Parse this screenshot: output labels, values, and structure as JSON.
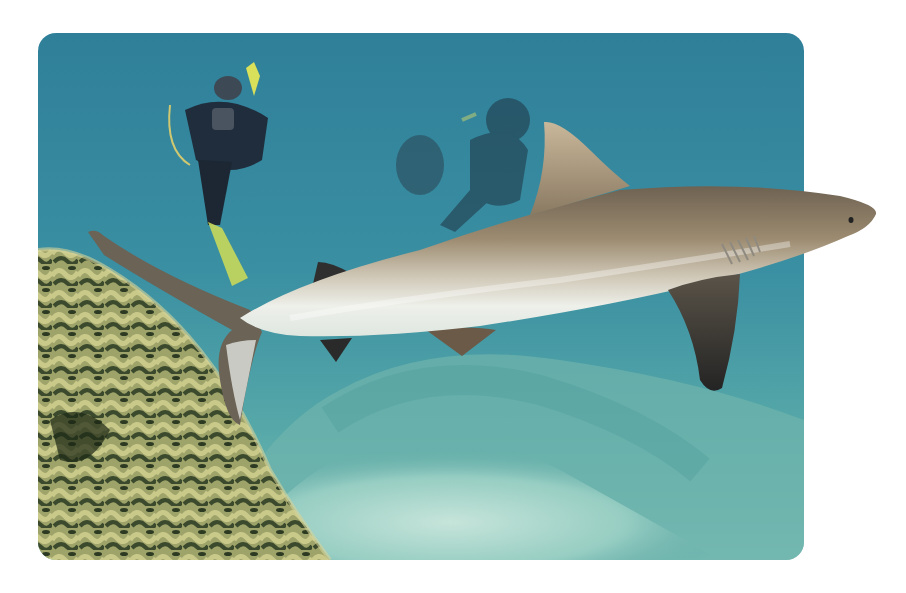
{
  "image": {
    "subject": "Grey reef shark swimming past coral with scuba divers in background",
    "elements": [
      "shark",
      "scuba-diver",
      "scuba-diver",
      "coral-reef",
      "sandy-seafloor",
      "open-water"
    ]
  },
  "colors": {
    "water_deep": "#2f7f99",
    "water_mid": "#3f95a3",
    "water_light": "#7cc0b8",
    "sand": "#a9d6cc",
    "coral_light": "#c9c98a",
    "coral_dark": "#3b4a2c",
    "shark_back": "#8a7a62",
    "shark_belly": "#e9ebe4",
    "fin_dark": "#3a3a3a",
    "diver_suit": "#1f2d3c",
    "diver_accent": "#d9e05a",
    "frame_bg": "#ffffff"
  }
}
